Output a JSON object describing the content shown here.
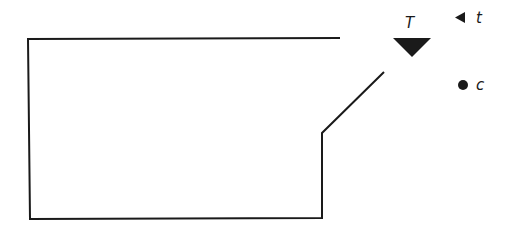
{
  "diagram": {
    "shape": {
      "points": [
        [
          340,
          38
        ],
        [
          28,
          39
        ],
        [
          30,
          219
        ],
        [
          322,
          218
        ],
        [
          322,
          133
        ],
        [
          384,
          72
        ]
      ],
      "stroke": "#1a1a1a"
    },
    "big_triangle": {
      "label": "T",
      "points": [
        [
          393,
          38
        ],
        [
          431,
          38
        ],
        [
          412,
          57
        ]
      ],
      "fill": "#1a1a1a"
    },
    "legend": [
      {
        "icon": "left-triangle-icon",
        "label": "t"
      },
      {
        "icon": "dot-icon",
        "label": "c"
      }
    ]
  }
}
